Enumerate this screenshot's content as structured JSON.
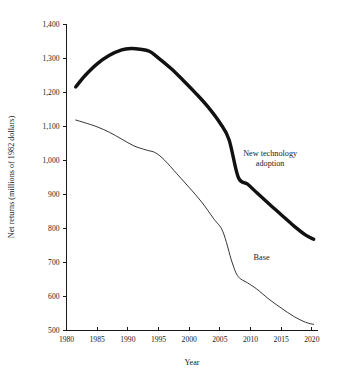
{
  "chart_data": {
    "type": "line",
    "title": "",
    "xlabel": "Year",
    "ylabel": "Net returns (millions of 1982 dollars)",
    "xlim": [
      1980,
      2021
    ],
    "ylim": [
      500,
      1400
    ],
    "grid": false,
    "legend_position": "inline-annotations",
    "xticks": [
      1980,
      1985,
      1990,
      1995,
      2000,
      2005,
      2010,
      2015,
      2020
    ],
    "xticklabels": [
      "1980",
      "1985",
      "1990",
      "1995",
      "2000",
      "2005",
      "2010",
      "2015",
      "2020"
    ],
    "yticks": [
      500,
      600,
      700,
      800,
      900,
      1000,
      1100,
      1200,
      1300,
      1400
    ],
    "yticklabels": [
      "500",
      "600",
      "700",
      "800",
      "900",
      "1,000",
      "1,100",
      "1,200",
      "1,300",
      "1,400"
    ],
    "series": [
      {
        "name": "New technology adoption",
        "style": "thick",
        "color": "#111111",
        "x": [
          1981.5,
          1983,
          1985,
          1987,
          1989,
          1990.5,
          1992,
          1993.5,
          1995,
          1997,
          1999,
          2001,
          2003,
          2005,
          2006.5,
          2008,
          2009.5,
          2011,
          2013,
          2015,
          2017,
          2019,
          2020.3
        ],
        "values": [
          1215,
          1248,
          1283,
          1308,
          1324,
          1328,
          1326,
          1320,
          1300,
          1270,
          1235,
          1198,
          1158,
          1110,
          1060,
          950,
          930,
          905,
          872,
          840,
          808,
          780,
          768
        ]
      },
      {
        "name": "Base",
        "style": "thin",
        "color": "#111111",
        "x": [
          1981.5,
          1983,
          1985,
          1987,
          1989,
          1991,
          1993,
          1994.5,
          1996,
          1998,
          2000,
          2002,
          2004,
          2005.5,
          2007,
          2008,
          2009.5,
          2011,
          2013,
          2015,
          2017,
          2019,
          2020.3
        ],
        "values": [
          1118,
          1110,
          1098,
          1082,
          1062,
          1042,
          1030,
          1022,
          1000,
          960,
          920,
          878,
          828,
          790,
          700,
          658,
          640,
          622,
          592,
          566,
          542,
          524,
          518
        ]
      }
    ],
    "annotations": [
      {
        "text_line1": "New technology",
        "text_line2": "adoption",
        "x": 2013.2,
        "y": 1012
      },
      {
        "text_line1": "Base",
        "text_line2": "",
        "x": 2011.8,
        "y": 706
      }
    ]
  },
  "figure": {
    "caption_fragment": ""
  }
}
